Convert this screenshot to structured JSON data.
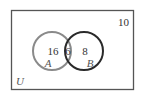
{
  "diagram": {
    "type": "venn",
    "universe": {
      "label": "U",
      "outside_count": "10"
    },
    "sets": [
      {
        "label": "A",
        "only_count": "16",
        "color": "#8a8a8a"
      },
      {
        "label": "B",
        "only_count": "8",
        "color": "#2a2a2a"
      }
    ],
    "intersection": {
      "count": "6"
    }
  },
  "colors": {
    "border": "#555555",
    "set_a": "#8a8a8a",
    "set_b": "#2a2a2a",
    "text": "#333333"
  }
}
